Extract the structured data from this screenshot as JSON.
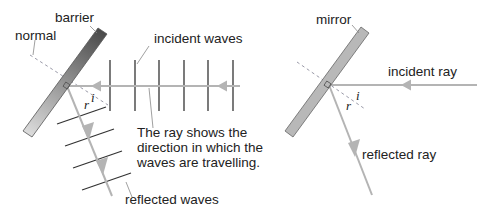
{
  "left_panel": {
    "labels": {
      "barrier": "barrier",
      "normal": "normal",
      "incident_waves": "incident waves",
      "reflected_waves": "reflected waves",
      "angle_i": "i",
      "angle_r": "r"
    },
    "caption": {
      "line1": "The ray shows the",
      "line2": "direction in which the",
      "line3": "waves are travelling."
    }
  },
  "right_panel": {
    "labels": {
      "mirror": "mirror",
      "incident_ray": "incident ray",
      "reflected_ray": "reflected ray",
      "angle_i": "i",
      "angle_r": "r"
    }
  },
  "colors": {
    "ray": "#b4b4b4",
    "wavefront": "#333333",
    "normal_dashed": "#9a9aa8",
    "barrier_dark": "#555555",
    "barrier_light": "#d8d8d8",
    "mirror_fill": "#b8b8b8",
    "mirror_outline": "#666666",
    "text": "#222222"
  }
}
